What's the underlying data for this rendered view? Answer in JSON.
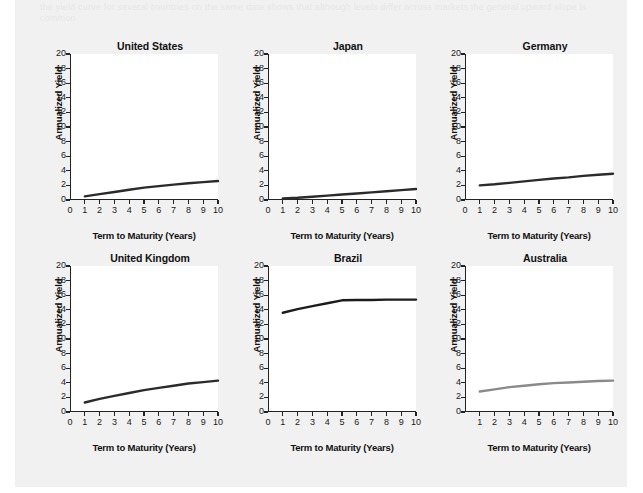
{
  "page": {
    "background_color": "#f1f1f1",
    "margin_color": "#ffffff",
    "bleed_text": "the yield curve for several countries on the same date shows that although levels differ across markets the general upward slope is common"
  },
  "chart_data": [
    {
      "type": "line",
      "title": "United States",
      "xlabel": "Term to Maturity (Years)",
      "ylabel": "Annualized Yield",
      "x": [
        1,
        2,
        3,
        4,
        5,
        6,
        7,
        8,
        9,
        10
      ],
      "values": [
        0.5,
        0.8,
        1.1,
        1.4,
        1.7,
        1.9,
        2.1,
        2.3,
        2.45,
        2.6
      ],
      "xlim": [
        0,
        10
      ],
      "ylim": [
        0,
        20
      ],
      "xticks": [
        0,
        1,
        2,
        3,
        4,
        5,
        6,
        7,
        8,
        9,
        10
      ],
      "yticks": [
        0,
        2,
        4,
        6,
        8,
        10,
        12,
        14,
        16,
        18,
        20
      ],
      "line_color": "#2b2b2b",
      "grid": false,
      "legend": "none"
    },
    {
      "type": "line",
      "title": "Japan",
      "xlabel": "Term to Maturity (Years)",
      "ylabel": "Annualized Yield",
      "x": [
        1,
        2,
        3,
        4,
        5,
        6,
        7,
        8,
        9,
        10
      ],
      "values": [
        0.2,
        0.3,
        0.45,
        0.6,
        0.75,
        0.9,
        1.05,
        1.2,
        1.35,
        1.5
      ],
      "xlim": [
        0,
        10
      ],
      "ylim": [
        0,
        20
      ],
      "xticks": [
        0,
        1,
        2,
        3,
        4,
        5,
        6,
        7,
        8,
        9,
        10
      ],
      "yticks": [
        0,
        2,
        4,
        6,
        8,
        10,
        12,
        14,
        16,
        18,
        20
      ],
      "line_color": "#2b2b2b",
      "grid": false,
      "legend": "none"
    },
    {
      "type": "line",
      "title": "Germany",
      "xlabel": "Term to Maturity (Years)",
      "ylabel": "Annualized Yield",
      "x": [
        1,
        2,
        3,
        4,
        5,
        6,
        7,
        8,
        9,
        10
      ],
      "values": [
        2.0,
        2.15,
        2.35,
        2.55,
        2.75,
        2.95,
        3.1,
        3.3,
        3.45,
        3.6
      ],
      "xlim": [
        0,
        10
      ],
      "ylim": [
        0,
        20
      ],
      "xticks": [
        0,
        1,
        2,
        3,
        4,
        5,
        6,
        7,
        8,
        9,
        10
      ],
      "yticks": [
        0,
        2,
        4,
        6,
        8,
        10,
        12,
        14,
        16,
        18,
        20
      ],
      "line_color": "#2b2b2b",
      "grid": false,
      "legend": "none"
    },
    {
      "type": "line",
      "title": "United Kingdom",
      "xlabel": "Term to Maturity (Years)",
      "ylabel": "Annualized Yield",
      "x": [
        1,
        2,
        3,
        4,
        5,
        6,
        7,
        8,
        9,
        10
      ],
      "values": [
        1.3,
        1.8,
        2.2,
        2.6,
        3.0,
        3.3,
        3.6,
        3.9,
        4.1,
        4.3
      ],
      "xlim": [
        0,
        10
      ],
      "ylim": [
        0,
        20
      ],
      "xticks": [
        0,
        1,
        2,
        3,
        4,
        5,
        6,
        7,
        8,
        9,
        10
      ],
      "yticks": [
        0,
        2,
        4,
        6,
        8,
        10,
        12,
        14,
        16,
        18,
        20
      ],
      "line_color": "#2b2b2b",
      "grid": false,
      "legend": "none"
    },
    {
      "type": "line",
      "title": "Brazil",
      "xlabel": "Term to Maturity (Years)",
      "ylabel": "Annualized Yield",
      "x": [
        1,
        2,
        3,
        4,
        5,
        6,
        7,
        8,
        9,
        10
      ],
      "values": [
        13.6,
        14.1,
        14.5,
        14.9,
        15.3,
        15.35,
        15.35,
        15.4,
        15.4,
        15.4
      ],
      "xlim": [
        0,
        10
      ],
      "ylim": [
        0,
        20
      ],
      "xticks": [
        0,
        1,
        2,
        3,
        4,
        5,
        6,
        7,
        8,
        9,
        10
      ],
      "yticks": [
        0,
        2,
        4,
        6,
        8,
        10,
        12,
        14,
        16,
        18,
        20
      ],
      "line_color": "#1c1c1c",
      "grid": false,
      "legend": "none"
    },
    {
      "type": "line",
      "title": "Australia",
      "xlabel": "Term to Maturity (Years)",
      "ylabel": "Annualized Yield",
      "x": [
        1,
        2,
        3,
        4,
        5,
        6,
        7,
        8,
        9,
        10
      ],
      "values": [
        2.8,
        3.1,
        3.4,
        3.6,
        3.8,
        3.95,
        4.05,
        4.15,
        4.25,
        4.3
      ],
      "xlim": [
        0,
        10
      ],
      "ylim": [
        0,
        20
      ],
      "xticks": [
        1,
        2,
        3,
        4,
        5,
        6,
        7,
        8,
        9,
        10
      ],
      "yticks": [
        0,
        2,
        4,
        6,
        8,
        10,
        12,
        14,
        16,
        18,
        20
      ],
      "line_color": "#8a8a8a",
      "grid": false,
      "legend": "none"
    }
  ]
}
